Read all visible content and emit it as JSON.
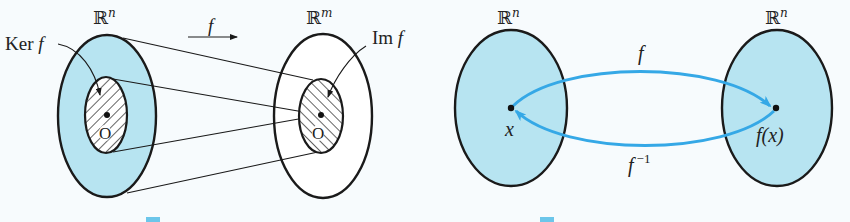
{
  "colors": {
    "background": "#f7fbfd",
    "domain_fill": "#b7e4f1",
    "outline": "#1a1a1a",
    "arc": "#35a8e6",
    "codomain_fill": "#ffffff"
  },
  "left_figure": {
    "domain_label": "ℝ",
    "domain_sup": "n",
    "codomain_label": "ℝ",
    "codomain_sup": "m",
    "map_label": "f",
    "kernel_label_prefix": "Ker",
    "kernel_label_func": "f",
    "image_label_prefix": "Im",
    "image_label_func": "f",
    "origin_left": "O",
    "origin_right": "O"
  },
  "right_figure": {
    "left_space_label": "ℝ",
    "left_space_sup": "n",
    "right_space_label": "ℝ",
    "right_space_sup": "n",
    "forward_map": "f",
    "inverse_map": "f",
    "inverse_sup": "−1",
    "point_label": "x",
    "image_point_label": "f(x)"
  }
}
